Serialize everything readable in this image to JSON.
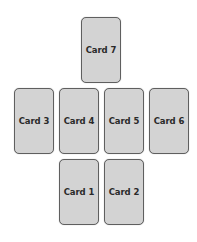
{
  "diagram": {
    "type": "card-spread-layout",
    "cards": [
      {
        "label": "Card 7",
        "row": 1,
        "x": 81,
        "y": 17
      },
      {
        "label": "Card 3",
        "row": 2,
        "x": 14,
        "y": 88
      },
      {
        "label": "Card 4",
        "row": 2,
        "x": 59,
        "y": 88
      },
      {
        "label": "Card 5",
        "row": 2,
        "x": 104,
        "y": 88
      },
      {
        "label": "Card 6",
        "row": 2,
        "x": 149,
        "y": 88
      },
      {
        "label": "Card 1",
        "row": 3,
        "x": 59,
        "y": 159
      },
      {
        "label": "Card 2",
        "row": 3,
        "x": 104,
        "y": 159
      }
    ],
    "colors": {
      "card_fill": "#d3d3d3",
      "card_border": "#5f5f5f",
      "text": "#2a2a2a",
      "background": "#ffffff"
    }
  }
}
